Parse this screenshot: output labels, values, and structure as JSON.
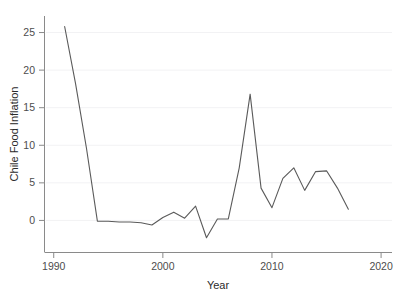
{
  "chart_data": {
    "type": "line",
    "title": "",
    "xlabel": "Year",
    "ylabel": "Chile Food Inflation",
    "xlim": [
      1989.2,
      2021.0
    ],
    "ylim": [
      -4.2,
      27.2
    ],
    "xticks": [
      1990,
      2000,
      2010,
      2020
    ],
    "xticklabels": [
      "1990",
      "2000",
      "2010",
      "2020"
    ],
    "yticks": [
      0,
      5,
      10,
      15,
      20,
      25
    ],
    "yticklabels": [
      "0",
      "5",
      "10",
      "15",
      "20",
      "25"
    ],
    "grid": "faint-horizontal",
    "legend": "none",
    "series": [
      {
        "name": "Chile Food Inflation",
        "x": [
          1991,
          1992,
          1993,
          1994,
          1995,
          1996,
          1997,
          1998,
          1999,
          2000,
          2001,
          2002,
          2003,
          2004,
          2005,
          2006,
          2007,
          2008,
          2009,
          2010,
          2011,
          2012,
          2013,
          2014,
          2015,
          2016,
          2017
        ],
        "values": [
          25.8,
          18.2,
          9.6,
          -0.1,
          -0.1,
          -0.2,
          -0.2,
          -0.3,
          -0.6,
          0.4,
          1.1,
          0.3,
          1.9,
          -2.3,
          0.2,
          0.2,
          7.0,
          16.8,
          4.3,
          1.7,
          5.6,
          7.0,
          4.0,
          6.5,
          6.6,
          4.3,
          1.5
        ]
      }
    ]
  },
  "axis": {
    "x_title": "Year",
    "y_title": "Chile Food Inflation"
  }
}
